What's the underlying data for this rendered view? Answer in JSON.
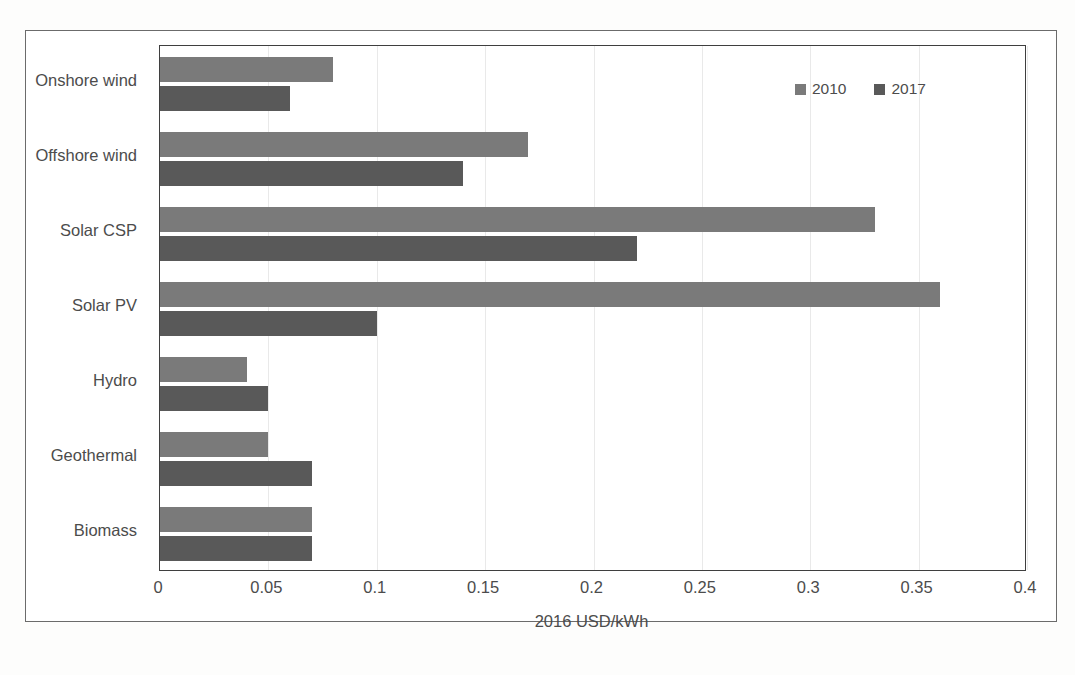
{
  "chart_data": {
    "type": "bar",
    "orientation": "horizontal",
    "title": "",
    "xlabel": "2016 USD/kWh",
    "ylabel": "",
    "xlim": [
      0,
      0.4
    ],
    "xticks": [
      "0",
      "0.05",
      "0.1",
      "0.15",
      "0.2",
      "0.25",
      "0.3",
      "0.35",
      "0.4"
    ],
    "xtick_values": [
      0,
      0.05,
      0.1,
      0.15,
      0.2,
      0.25,
      0.3,
      0.35,
      0.4
    ],
    "grid": true,
    "grid_axis": "x",
    "legend_position": "top-right",
    "categories": [
      "Onshore wind",
      "Offshore wind",
      "Solar CSP",
      "Solar PV",
      "Hydro",
      "Geothermal",
      "Biomass"
    ],
    "series": [
      {
        "name": "2010",
        "color": "#7a7a7a",
        "values": [
          0.08,
          0.17,
          0.33,
          0.36,
          0.04,
          0.05,
          0.07
        ]
      },
      {
        "name": "2017",
        "color": "#595959",
        "values": [
          0.06,
          0.14,
          0.22,
          0.1,
          0.05,
          0.07,
          0.07
        ]
      }
    ]
  },
  "legend": {
    "items": [
      {
        "label": "2010",
        "color": "#7a7a7a"
      },
      {
        "label": "2017",
        "color": "#595959"
      }
    ]
  },
  "axis": {
    "x_title": "2016 USD/kWh"
  },
  "colors": {
    "series_2010": "#7a7a7a",
    "series_2017": "#595959",
    "frame": "#6b6b6b",
    "axis": "#3f3f3f",
    "grid": "#e9e9e9",
    "text": "#4c4c4c",
    "background": "#fdfdfc"
  }
}
